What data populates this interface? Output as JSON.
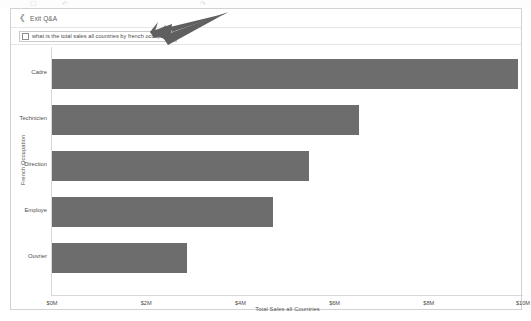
{
  "ribbon": {
    "icons": [
      "save-icon",
      "undo-icon",
      "redo-icon"
    ],
    "glyphs": [
      "☐",
      "↶",
      "↷"
    ]
  },
  "panel": {
    "exit_label": "Exit Q&A",
    "back_icon": "chevron-left-icon"
  },
  "question": {
    "value": "what is the total sales all countries by french occupation",
    "placeholder": "Ask a question about your data",
    "icon": "document-icon"
  },
  "annotation": {
    "arrow_icon": "arrow-pointing-left-icon",
    "color": "#5f5f5f"
  },
  "chart_data": {
    "type": "bar",
    "orientation": "horizontal",
    "title": "",
    "categories": [
      "Cadre",
      "Technicien",
      "Direction",
      "Employe",
      "Ouvrier"
    ],
    "values": [
      9.89,
      6.52,
      5.46,
      4.7,
      2.87
    ],
    "value_unit": "$M",
    "xlabel": "Total Sales all Countries",
    "ylabel": "French Occupation",
    "xlim": [
      0,
      10
    ],
    "xticks": [
      0,
      2,
      4,
      6,
      8,
      10
    ],
    "xtick_labels": [
      "$0M",
      "$2M",
      "$4M",
      "$6M",
      "$8M",
      "$10M"
    ],
    "grid": false,
    "legend": false,
    "bar_color": "#6d6d6d"
  }
}
